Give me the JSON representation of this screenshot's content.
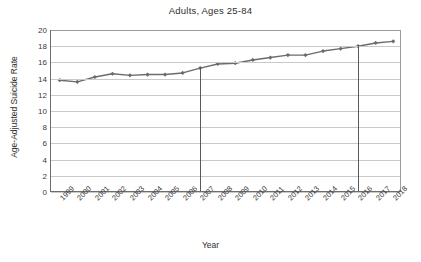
{
  "chart_data": {
    "type": "line",
    "title": "Adults, Ages 25-84",
    "xlabel": "Year",
    "ylabel": "Age-Adjusted Suicide Rate",
    "categories": [
      "1999",
      "2000",
      "2001",
      "2002",
      "2003",
      "2004",
      "2005",
      "2006",
      "2007",
      "2008",
      "2009",
      "2010",
      "2011",
      "2012",
      "2013",
      "2014",
      "2015",
      "2016",
      "2017",
      "2018"
    ],
    "values": [
      13.8,
      13.6,
      14.2,
      14.6,
      14.4,
      14.5,
      14.5,
      14.7,
      15.3,
      15.8,
      15.9,
      16.3,
      16.6,
      16.9,
      16.9,
      17.4,
      17.7,
      18.0,
      18.4,
      18.6
    ],
    "series": [
      {
        "name": "Age-Adjusted Suicide Rate",
        "color": "#6b6b6b",
        "values": [
          13.8,
          13.6,
          14.2,
          14.6,
          14.4,
          14.5,
          14.5,
          14.7,
          15.3,
          15.8,
          15.9,
          16.3,
          16.6,
          16.9,
          16.9,
          17.4,
          17.7,
          18.0,
          18.4,
          18.6
        ]
      }
    ],
    "ylim": [
      0,
      20
    ],
    "yticks": [
      0,
      2,
      4,
      6,
      8,
      10,
      12,
      14,
      16,
      18,
      20
    ],
    "grid": "horizontal",
    "legend": "none",
    "marker": "diamond",
    "annotations": [
      {
        "type": "vertical-line",
        "x": "2007",
        "label": ""
      },
      {
        "type": "vertical-line",
        "x": "2016",
        "label": ""
      }
    ]
  },
  "colors": {
    "line": "#6b6b6b",
    "grid": "#c9c9c9",
    "axis": "#6d6d6d",
    "text": "#3a3a3a",
    "background": "#ffffff"
  }
}
